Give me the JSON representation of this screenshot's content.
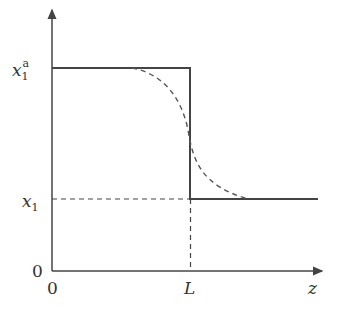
{
  "figure": {
    "type": "concentration-profile-diagram",
    "axes": {
      "x_label": "z",
      "y_label": "",
      "origin_x_label": "0",
      "origin_y_label": "0",
      "x_tick_label": "L"
    },
    "y_ticks": {
      "upper": {
        "base": "x",
        "sub": "1",
        "sup": "a"
      },
      "lower": {
        "base": "x",
        "sub": "1"
      }
    },
    "curves": [
      {
        "name": "step-profile",
        "style": "solid",
        "description": "x1^a for 0<z<L, drops to x1 at z=L"
      },
      {
        "name": "smoothed-profile",
        "style": "dashed",
        "description": "sigmoid transition around z=L"
      }
    ],
    "guides": [
      {
        "name": "x1-level-guide",
        "style": "dashed"
      },
      {
        "name": "L-guide",
        "style": "dashed"
      }
    ],
    "colors": {
      "line": "#444444",
      "text": "#333333",
      "background": "#ffffff"
    }
  }
}
